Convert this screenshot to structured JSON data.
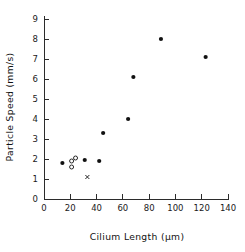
{
  "chart_data": {
    "type": "scatter",
    "title": "",
    "xlabel": "Cilium Length (µm)",
    "ylabel": "Particle Speed (mm/s)",
    "xlim": [
      0,
      140
    ],
    "ylim": [
      0,
      9
    ],
    "xticks": [
      0,
      20,
      40,
      60,
      80,
      100,
      120,
      140
    ],
    "yticks": [
      0,
      1,
      2,
      3,
      4,
      5,
      6,
      7,
      8,
      9
    ],
    "xtick_labels": [
      "0",
      "20",
      "40",
      "60",
      "80",
      "100",
      "120",
      "140"
    ],
    "ytick_labels": [
      "0",
      "1",
      "2",
      "3",
      "4",
      "5",
      "6",
      "7",
      "8",
      "9"
    ],
    "grid": false,
    "legend": "none",
    "series": [
      {
        "name": "filled-circles",
        "marker": "filled-circle",
        "color": "#111111",
        "points": [
          {
            "x": 14,
            "y": 1.8
          },
          {
            "x": 31,
            "y": 1.95
          },
          {
            "x": 42,
            "y": 1.9
          },
          {
            "x": 45,
            "y": 3.3
          },
          {
            "x": 64,
            "y": 4.0
          },
          {
            "x": 68,
            "y": 6.1
          },
          {
            "x": 89,
            "y": 8.0
          },
          {
            "x": 123,
            "y": 7.1
          }
        ]
      },
      {
        "name": "open-circles",
        "marker": "open-circle",
        "color": "#111111",
        "points": [
          {
            "x": 21,
            "y": 1.6
          },
          {
            "x": 21,
            "y": 1.9
          },
          {
            "x": 24,
            "y": 2.05
          }
        ]
      },
      {
        "name": "cross-markers",
        "marker": "x",
        "color": "#111111",
        "points": [
          {
            "x": 33,
            "y": 1.1
          }
        ]
      }
    ]
  },
  "figure": {
    "caption": "",
    "background": "#ffffff",
    "axis_color": "#2b2b2b",
    "marker_color": "#111111"
  }
}
